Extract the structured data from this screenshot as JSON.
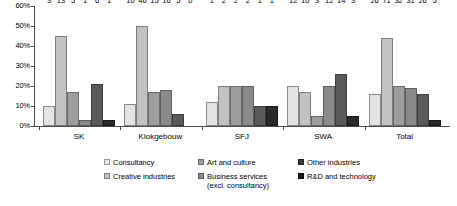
{
  "chart_data": {
    "type": "bar",
    "title": "",
    "subtitle": "",
    "xlabel": "",
    "ylabel": "",
    "ylim": [
      0,
      60
    ],
    "y_unit": "%",
    "grid": false,
    "legend_position": "bottom",
    "y_ticks": [
      "0%",
      "10%",
      "20%",
      "30%",
      "40%",
      "50%",
      "60%"
    ],
    "y_tick_values": [
      0,
      10,
      20,
      30,
      40,
      50,
      60
    ],
    "categories": [
      "SK",
      "Klokgebouw",
      "SFJ",
      "SWA",
      "Total"
    ],
    "series": [
      {
        "name": "Consultancy",
        "color": "#e3e3e3",
        "values": [
          10,
          11,
          12,
          20,
          16
        ],
        "labels": [
          "3",
          "10",
          "1",
          "12",
          "26"
        ]
      },
      {
        "name": "Creative industries",
        "color": "#c2c2c2",
        "values": [
          45,
          50,
          20,
          17,
          44
        ],
        "labels": [
          "13",
          "46",
          "2",
          "10",
          "71"
        ]
      },
      {
        "name": "Art and culture",
        "color": "#9d9d9d",
        "values": [
          17,
          17,
          20,
          5,
          20
        ],
        "labels": [
          "5",
          "15",
          "2",
          "3",
          "32"
        ]
      },
      {
        "name": "Business services (excl. consultancy)",
        "color": "#8a8a8a",
        "values": [
          3,
          18,
          20,
          20,
          19
        ],
        "labels": [
          "1",
          "16",
          "2",
          "12",
          "31"
        ]
      },
      {
        "name": "Other industries",
        "color": "#5a5a5a",
        "values": [
          21,
          6,
          10,
          26,
          16
        ],
        "labels": [
          "6",
          "5",
          "1",
          "14",
          "26"
        ]
      },
      {
        "name": "R&D and technology",
        "color": "#2a2a2a",
        "values": [
          3,
          0,
          10,
          5,
          3
        ],
        "labels": [
          "1",
          "0",
          "1",
          "3",
          "5"
        ]
      }
    ]
  },
  "legend": {
    "items": [
      {
        "label": "Consultancy",
        "swatch": "s0"
      },
      {
        "label": "Art and culture",
        "swatch": "s2"
      },
      {
        "label": "Other industries",
        "swatch": "s4"
      },
      {
        "label": "Creative industries",
        "swatch": "s1"
      },
      {
        "label": "Business services\n(excl. consultancy)",
        "swatch": "s3"
      },
      {
        "label": "R&D and technology",
        "swatch": "s5"
      }
    ]
  }
}
